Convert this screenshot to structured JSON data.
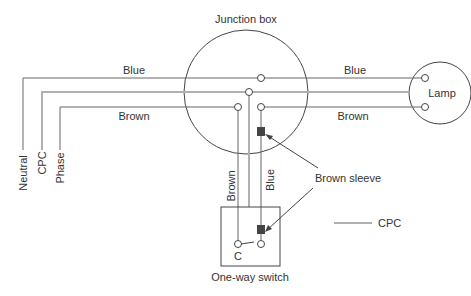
{
  "title": "Junction box",
  "colors": {
    "wire": "#666666",
    "cpc": "#b0b0b0",
    "outline": "#444444",
    "sleeve": "#444444",
    "text": "#333333"
  },
  "labels": {
    "junction_box": "Junction box",
    "blue_top_left": "Blue",
    "blue_top_right": "Blue",
    "brown_left": "Brown",
    "brown_right": "Brown",
    "lamp": "Lamp",
    "neutral": "Neutral",
    "cpc_vertical": "CPC",
    "phase": "Phase",
    "brown_vertical": "Brown",
    "blue_vertical": "Blue",
    "brown_sleeve": "Brown sleeve",
    "switch_common": "C",
    "switch": "One-way switch",
    "legend_cpc": "CPC"
  },
  "legend": [
    {
      "line": "grey",
      "label": "CPC"
    }
  ]
}
